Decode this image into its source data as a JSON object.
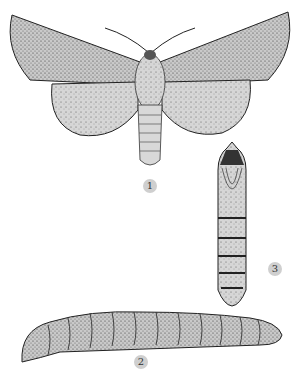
{
  "figure": {
    "type": "scientific-illustration",
    "colors": {
      "ink": "#2a2a2a",
      "fill": "#bdbdbd",
      "label_bg": "#cfcfcf",
      "background": "#ffffff"
    },
    "labels": [
      {
        "id": "adult",
        "text": "1"
      },
      {
        "id": "larva",
        "text": "2"
      },
      {
        "id": "pupa",
        "text": "3"
      }
    ],
    "caption": ""
  }
}
